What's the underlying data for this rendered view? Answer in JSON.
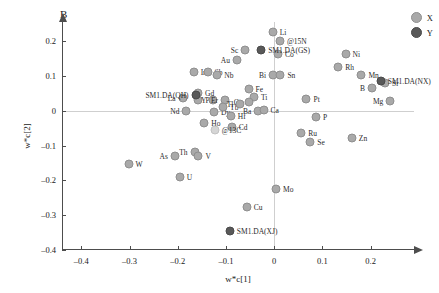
{
  "panel": {
    "letter": "B"
  },
  "legend": {
    "position": "top-right",
    "entries": [
      {
        "label": "X",
        "color": "#a9a9a9",
        "group": "x"
      },
      {
        "label": "Y",
        "color": "#595959",
        "group": "y"
      }
    ]
  },
  "chart_data": {
    "type": "scatter",
    "title": "B",
    "xlabel": "w*c[1]",
    "ylabel": "w*c[2]",
    "xlim": [
      -0.44,
      0.29
    ],
    "ylim": [
      -0.4,
      0.255
    ],
    "xticks": [
      -0.4,
      -0.3,
      -0.2,
      -0.1,
      0,
      0.1,
      0.2
    ],
    "xticklabels": [
      "–0.4",
      "–0.3",
      "–0.2",
      "–0.1",
      "0",
      "0.1",
      "0.2"
    ],
    "yticks": [
      0.2,
      0.1,
      0,
      -0.1,
      -0.2,
      -0.3,
      -0.4
    ],
    "yticklabels": [
      "0.2",
      "0.1",
      "0",
      "–0.1",
      "–0.2",
      "–0.3",
      "–0.4"
    ],
    "grid": false,
    "zero_lines": true,
    "series": [
      {
        "name": "X",
        "color": "#a9a9a9",
        "points": [
          {
            "label": "W",
            "x": -0.302,
            "y": -0.152,
            "lpos": "right"
          },
          {
            "label": "As",
            "x": -0.206,
            "y": -0.13,
            "lpos": "left"
          },
          {
            "label": "U",
            "x": -0.196,
            "y": -0.19,
            "lpos": "right"
          },
          {
            "label": "Th",
            "x": -0.165,
            "y": -0.118,
            "lpos": "left"
          },
          {
            "label": "V",
            "x": -0.157,
            "y": -0.131,
            "lpos": "right"
          },
          {
            "label": "Nd",
            "x": -0.182,
            "y": -0.002,
            "lpos": "left"
          },
          {
            "label": "La",
            "x": -0.19,
            "y": 0.036,
            "lpos": "left"
          },
          {
            "label": "Ir",
            "x": -0.167,
            "y": 0.112,
            "lpos": "right"
          },
          {
            "label": "Sb",
            "x": -0.138,
            "y": 0.112,
            "lpos": "right"
          },
          {
            "label": "Nb",
            "x": -0.118,
            "y": 0.103,
            "lpos": "right"
          },
          {
            "label": "Pr",
            "x": -0.157,
            "y": 0.031,
            "lpos": "right"
          },
          {
            "label": "Y",
            "x": -0.126,
            "y": 0.032,
            "lpos": "left"
          },
          {
            "label": "Dy",
            "x": -0.125,
            "y": -0.004,
            "lpos": "right"
          },
          {
            "label": "Ho",
            "x": -0.145,
            "y": -0.035,
            "lpos": "right"
          },
          {
            "label": "Er",
            "x": -0.102,
            "y": 0.03,
            "lpos": "left"
          },
          {
            "label": "Tb",
            "x": -0.106,
            "y": 0.012,
            "lpos": "right"
          },
          {
            "label": "Hf",
            "x": -0.09,
            "y": -0.014,
            "lpos": "right"
          },
          {
            "label": "Cd",
            "x": -0.088,
            "y": -0.048,
            "lpos": "right"
          },
          {
            "label": "@13C",
            "x": -0.123,
            "y": -0.055,
            "lpos": "right"
          },
          {
            "label": "Sc",
            "x": -0.06,
            "y": 0.175,
            "lpos": "left"
          },
          {
            "label": "Au",
            "x": -0.077,
            "y": 0.146,
            "lpos": "left"
          },
          {
            "label": "Fe",
            "x": -0.053,
            "y": 0.063,
            "lpos": "right"
          },
          {
            "label": "Ti",
            "x": -0.042,
            "y": 0.04,
            "lpos": "right"
          },
          {
            "label": "Cs",
            "x": -0.053,
            "y": 0.024,
            "lpos": "left"
          },
          {
            "label": "Tl",
            "x": -0.07,
            "y": 0.02,
            "lpos": "left"
          },
          {
            "label": "Ba",
            "x": -0.033,
            "y": 0.0,
            "lpos": "left"
          },
          {
            "label": "Ca",
            "x": -0.022,
            "y": 0.001,
            "lpos": "right"
          },
          {
            "label": "Li",
            "x": -0.003,
            "y": 0.225,
            "lpos": "right"
          },
          {
            "label": "@15N",
            "x": 0.012,
            "y": 0.201,
            "lpos": "right"
          },
          {
            "label": "Co",
            "x": 0.008,
            "y": 0.164,
            "lpos": "right"
          },
          {
            "label": "Bi",
            "x": -0.002,
            "y": 0.104,
            "lpos": "left"
          },
          {
            "label": "Sn",
            "x": 0.013,
            "y": 0.104,
            "lpos": "right"
          },
          {
            "label": "Mo",
            "x": 0.004,
            "y": -0.225,
            "lpos": "right"
          },
          {
            "label": "Cu",
            "x": -0.057,
            "y": -0.276,
            "lpos": "right"
          },
          {
            "label": "Ru",
            "x": 0.056,
            "y": -0.063,
            "lpos": "right"
          },
          {
            "label": "Se",
            "x": 0.075,
            "y": -0.091,
            "lpos": "right"
          },
          {
            "label": "Pt",
            "x": 0.067,
            "y": 0.035,
            "lpos": "right"
          },
          {
            "label": "P",
            "x": 0.087,
            "y": -0.017,
            "lpos": "right"
          },
          {
            "label": "Ni",
            "x": 0.148,
            "y": 0.163,
            "lpos": "right"
          },
          {
            "label": "Rh",
            "x": 0.133,
            "y": 0.125,
            "lpos": "right"
          },
          {
            "label": "Mn",
            "x": 0.181,
            "y": 0.103,
            "lpos": "right"
          },
          {
            "label": "Sr",
            "x": 0.23,
            "y": 0.08,
            "lpos": "right"
          },
          {
            "label": "B",
            "x": 0.203,
            "y": 0.066,
            "lpos": "left"
          },
          {
            "label": "Mg",
            "x": 0.241,
            "y": 0.029,
            "lpos": "left"
          },
          {
            "label": "Zn",
            "x": 0.161,
            "y": -0.079,
            "lpos": "right"
          },
          {
            "label": "Gd",
            "x": -0.158,
            "y": 0.052,
            "lpos": "right"
          }
        ]
      },
      {
        "name": "Y",
        "color": "#595959",
        "points": [
          {
            "label": "SM1.DA(QH)",
            "x": -0.163,
            "y": 0.046,
            "lpos": "left"
          },
          {
            "label": "SM1.DA(GS)",
            "x": -0.027,
            "y": 0.175,
            "lpos": "right"
          },
          {
            "label": "SM1.DA(NX)",
            "x": 0.221,
            "y": 0.086,
            "lpos": "right"
          },
          {
            "label": "SM1.DA(XJ)",
            "x": -0.092,
            "y": -0.345,
            "lpos": "right"
          }
        ]
      }
    ]
  }
}
